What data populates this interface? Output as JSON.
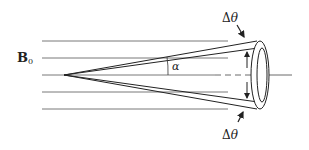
{
  "diagram": {
    "type": "physics-schematic",
    "labels": {
      "field": "B",
      "field_subscript": "0",
      "cone_half_angle": "α",
      "spread_top": "Δθ",
      "spread_bottom": "Δθ",
      "spread_top_delta": "Δ",
      "spread_top_theta": "θ",
      "spread_bottom_delta": "Δ",
      "spread_bottom_theta": "θ"
    },
    "field_lines": [
      41,
      58,
      75,
      92,
      109
    ],
    "colors": {
      "stroke": "#333333",
      "field_line": "#555555",
      "background": "#ffffff"
    }
  }
}
